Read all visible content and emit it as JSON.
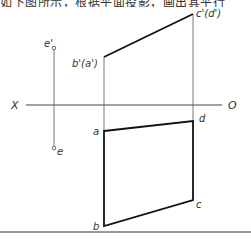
{
  "header": {
    "clipped_text": "如下图所示，根据平面投影，画出其平行"
  },
  "diagram": {
    "axis": {
      "left_label": "X",
      "right_label": "O"
    },
    "front_view": {
      "points": [
        {
          "id": "b_prime",
          "label": "b'(a')"
        },
        {
          "id": "c_prime",
          "label": "c'(d')"
        }
      ]
    },
    "top_view": {
      "points": [
        {
          "id": "a",
          "label": "a"
        },
        {
          "id": "b",
          "label": "b"
        },
        {
          "id": "c",
          "label": "c"
        },
        {
          "id": "d",
          "label": "d"
        }
      ]
    },
    "point_e": {
      "front_label": "e'",
      "top_label": "e"
    }
  }
}
